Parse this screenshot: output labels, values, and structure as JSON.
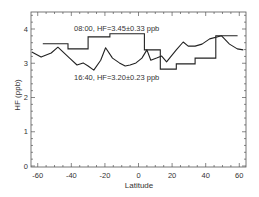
{
  "chart_data": {
    "type": "line",
    "title": "",
    "xlabel": "Latitude",
    "ylabel": "HF (ppb)",
    "xlim": [
      -64,
      64
    ],
    "ylim": [
      0,
      4.5
    ],
    "x_ticks": [
      -60,
      -40,
      -20,
      0,
      20,
      40,
      60
    ],
    "x_tick_labels": [
      "-60",
      "-40",
      "-20",
      "0",
      "20",
      "40",
      "60"
    ],
    "y_ticks": [
      0,
      1,
      2,
      3,
      4
    ],
    "y_tick_labels": [
      "0",
      "1",
      "2",
      "3",
      "4"
    ],
    "grid": false,
    "legend": "none",
    "annotations": [
      {
        "text": "08:00, HF=3.45±0.33 ppb",
        "x": -38,
        "y": 4.03
      },
      {
        "text": "16:40, HF=3.20±0.23 ppb",
        "x": -38,
        "y": 2.6
      }
    ],
    "series": [
      {
        "name": "08:00",
        "style": "step",
        "color": "#222222",
        "steps": [
          {
            "x0": -57,
            "x1": -42,
            "y": 3.57
          },
          {
            "x0": -42,
            "x1": -30,
            "y": 3.42
          },
          {
            "x0": -30,
            "x1": -17,
            "y": 3.77
          },
          {
            "x0": -17,
            "x1": 3.5,
            "y": 3.86
          },
          {
            "x0": 3.5,
            "x1": 13,
            "y": 3.39
          },
          {
            "x0": 13,
            "x1": 22.5,
            "y": 2.83
          },
          {
            "x0": 22.5,
            "x1": 33.7,
            "y": 2.98
          },
          {
            "x0": 33.7,
            "x1": 46,
            "y": 3.15
          },
          {
            "x0": 46,
            "x1": 59,
            "y": 3.8
          }
        ]
      },
      {
        "name": "16:40",
        "style": "line",
        "color": "#222222",
        "x": [
          -63.5,
          -58,
          -52,
          -48,
          -41,
          -36.6,
          -33,
          -30,
          -26.6,
          -22.5,
          -19.6,
          -15.5,
          -11.4,
          -7.9,
          -5,
          -1.5,
          2,
          5,
          7.3,
          10.8,
          13.8,
          16.7,
          19,
          22.5,
          26.6,
          29.6,
          33.7,
          37.8,
          42.4,
          49.5,
          54.2,
          58.8,
          62.4
        ],
        "y": [
          3.33,
          3.18,
          3.3,
          3.47,
          3.15,
          2.95,
          3.01,
          2.92,
          2.8,
          3.09,
          3.45,
          3.15,
          3.01,
          2.92,
          2.95,
          3.01,
          3.15,
          3.39,
          3.09,
          3.15,
          3.21,
          3.04,
          3.18,
          3.39,
          3.62,
          3.5,
          3.5,
          3.56,
          3.71,
          3.8,
          3.56,
          3.42,
          3.39
        ]
      }
    ]
  }
}
